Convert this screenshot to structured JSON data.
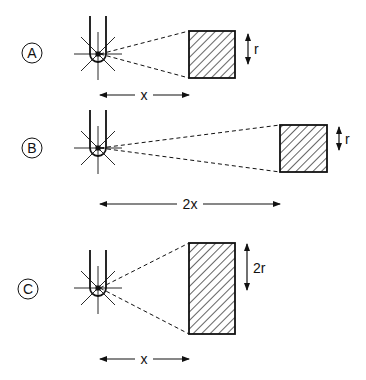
{
  "colors": {
    "ink": "#111111",
    "background": "#ffffff"
  },
  "panels": [
    {
      "label": "A",
      "source": {
        "cx": 98,
        "cy": 54
      },
      "target": {
        "x": 189,
        "y": 31,
        "w": 46,
        "h": 47
      },
      "height_label": "r",
      "height_arrow": {
        "x": 248,
        "y1": 34,
        "y2": 64
      },
      "height_label_pos": {
        "x": 254,
        "y": 54
      },
      "distance_label": "x",
      "distance_arrow": {
        "y": 95,
        "x1": 100,
        "x2": 189,
        "label_x": 144
      },
      "badge": {
        "cx": 32,
        "cy": 53
      }
    },
    {
      "label": "B",
      "source": {
        "cx": 98,
        "cy": 148
      },
      "target": {
        "x": 280,
        "y": 125,
        "w": 47,
        "h": 47
      },
      "height_label": "r",
      "height_arrow": {
        "x": 339,
        "y1": 127,
        "y2": 150
      },
      "height_label_pos": {
        "x": 345,
        "y": 144
      },
      "distance_label": "2x",
      "distance_arrow": {
        "y": 204,
        "x1": 100,
        "x2": 280,
        "label_x": 190
      },
      "badge": {
        "cx": 32,
        "cy": 148
      }
    },
    {
      "label": "C",
      "source": {
        "cx": 98,
        "cy": 288
      },
      "target": {
        "x": 189,
        "y": 243,
        "w": 46,
        "h": 91
      },
      "height_label": "2r",
      "height_arrow": {
        "x": 247,
        "y1": 244,
        "y2": 290
      },
      "height_label_pos": {
        "x": 253,
        "y": 273
      },
      "distance_label": "x",
      "distance_arrow": {
        "y": 359,
        "x1": 100,
        "x2": 189,
        "label_x": 144
      },
      "badge": {
        "cx": 28,
        "cy": 289
      }
    }
  ]
}
